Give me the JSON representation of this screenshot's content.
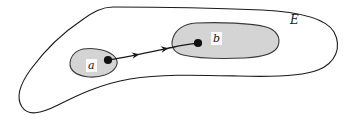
{
  "figure": {
    "type": "set-diagram",
    "background_color": "#ffffff",
    "stroke_color": "#1a1a1a",
    "fill_color": "#d4d4d4",
    "dot_color": "#101010",
    "label_box_color": "#fbfbfb"
  },
  "labels": {
    "outer_set": "E",
    "region_a": "a",
    "region_b": "b"
  },
  "regions": [
    {
      "name": "outer-set-E",
      "label": "E",
      "filled": false,
      "label_position": {
        "x": 290,
        "y": 14
      }
    },
    {
      "name": "subregion-a",
      "label": "a",
      "filled": true,
      "label_position": {
        "x": 86,
        "y": 59
      },
      "center": {
        "x": 95,
        "y": 63
      }
    },
    {
      "name": "subregion-b",
      "label": "b",
      "filled": true,
      "label_position": {
        "x": 211,
        "y": 32
      },
      "center": {
        "x": 225,
        "y": 40
      }
    }
  ],
  "points": [
    {
      "name": "point-in-a",
      "x": 108,
      "y": 60
    },
    {
      "name": "point-in-b",
      "x": 198,
      "y": 43
    }
  ],
  "path": {
    "name": "directed-path-a-to-b",
    "from": "point-in-a",
    "to": "point-in-b",
    "arrowheads": 2,
    "direction": "a-to-b"
  },
  "geometry": {
    "outer_boundary_d": "M 113 7 C 150 7 215 8 262 10 C 300 12 326 18 334 32 C 342 47 336 63 318 70 C 300 77 268 77 238 76 C 195 75 160 74 130 79 C 100 84 76 96 58 105 C 40 114 28 116 22 107 C 16 98 20 84 31 69 C 45 50 64 32 82 20 C 93 12 102 7 113 7 Z",
    "region_a_d": "M 83 49 C 96 47 110 51 115 57 C 120 63 116 71 105 75 C 93 79 79 77 73 71 C 67 65 70 52 83 49 Z",
    "region_b_d": "M 196 23 C 220 22 252 23 266 27 C 277 30 281 38 278 46 C 275 54 263 57 245 58 C 222 59 196 58 183 55 C 174 53 170 46 173 38 C 176 29 185 24 196 23 Z",
    "path_d": "M 108 60 C 128 57 155 51 174 47 C 184 45 192 44 198 43",
    "arrow1": {
      "x": 137,
      "y": 54.7,
      "angle": -10.5
    },
    "arrow2": {
      "x": 166,
      "y": 48.6,
      "angle": -10.5
    }
  }
}
